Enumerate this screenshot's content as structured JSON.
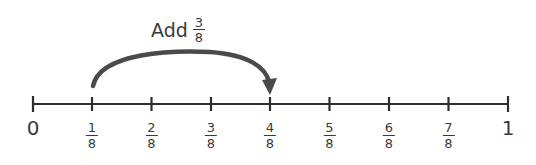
{
  "operation": {
    "verb": "Add",
    "fraction": {
      "numerator": "3",
      "denominator": "8"
    }
  },
  "number_line": {
    "start_label": "0",
    "end_label": "1",
    "fraction_labels": [
      {
        "numerator": "1",
        "denominator": "8"
      },
      {
        "numerator": "2",
        "denominator": "8"
      },
      {
        "numerator": "3",
        "denominator": "8"
      },
      {
        "numerator": "4",
        "denominator": "8"
      },
      {
        "numerator": "5",
        "denominator": "8"
      },
      {
        "numerator": "6",
        "denominator": "8"
      },
      {
        "numerator": "7",
        "denominator": "8"
      }
    ]
  },
  "jump": {
    "from": "1/8",
    "to": "4/8"
  },
  "colors": {
    "line": "#3a3a3a",
    "arc": "#4a4a4a"
  }
}
